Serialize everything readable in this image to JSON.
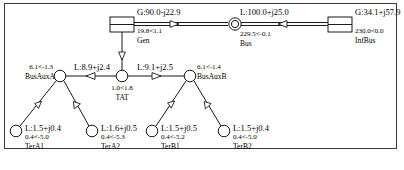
{
  "diagram": {
    "frame": {
      "border_color": "#3a3a3a"
    },
    "line_color": "#000000",
    "background": "#ffffff"
  },
  "nodes": [
    {
      "id": "gen",
      "name": "Gen",
      "symbol": "generator-box",
      "voltage": "19.8<1.1",
      "injection": "G:90.0-j22.9",
      "x": 122,
      "y": 25
    },
    {
      "id": "bus",
      "name": "Bus",
      "symbol": "bus-circle",
      "voltage": "229.5<-0.1",
      "injection": "L:100.0+j25.0",
      "x": 235,
      "y": 24
    },
    {
      "id": "infbus",
      "name": "InfBus",
      "symbol": "infinite-bus-box",
      "voltage": "230.0<0.0",
      "injection": "G:34.1+j57.9",
      "x": 340,
      "y": 24
    },
    {
      "id": "tat",
      "name": "TAT",
      "symbol": "node-circle",
      "voltage": "1.0<1.8",
      "x": 122,
      "y": 76
    },
    {
      "id": "busauxa",
      "name": "BusAuxA",
      "symbol": "node-circle",
      "voltage": "6.1<-1.3",
      "x": 60,
      "y": 76
    },
    {
      "id": "busauxb",
      "name": "BusAuxB",
      "symbol": "node-circle",
      "voltage": "6.1<-1.4",
      "x": 190,
      "y": 76
    },
    {
      "id": "tera1",
      "name": "TerA1",
      "symbol": "node-circle",
      "voltage": "0.4<-5.0",
      "injection": "L:1.5+j0.4",
      "x": 16,
      "y": 131
    },
    {
      "id": "tera2",
      "name": "TerA2",
      "symbol": "node-circle",
      "voltage": "0.4<-5.3",
      "injection": "L:1.6+j0.5",
      "x": 92,
      "y": 131
    },
    {
      "id": "terb1",
      "name": "TerB1",
      "symbol": "node-circle",
      "voltage": "0.4<-5.2",
      "injection": "L:1.5+j0.5",
      "x": 152,
      "y": 131
    },
    {
      "id": "terb2",
      "name": "TerB2",
      "symbol": "node-circle",
      "voltage": "0.4<-5.0",
      "injection": "L:1.5+j0.4",
      "x": 224,
      "y": 131
    }
  ],
  "branches": [
    {
      "id": "gen-bus",
      "from": "gen",
      "to": "bus",
      "style": "double",
      "flow_label": "G:90.0-j22.9",
      "arrow": "right"
    },
    {
      "id": "bus-infbus",
      "from": "bus",
      "to": "infbus",
      "style": "double",
      "flow_label": "L:100.0+j25.0",
      "arrow": "left"
    },
    {
      "id": "gen-tat",
      "from": "gen",
      "to": "tat",
      "style": "single",
      "flow_label": "",
      "arrow": "down"
    },
    {
      "id": "tat-busauxa",
      "from": "tat",
      "to": "busauxa",
      "style": "single",
      "flow_label": "L:8.9+j2.4",
      "arrow": "left"
    },
    {
      "id": "tat-busauxb",
      "from": "tat",
      "to": "busauxb",
      "style": "single",
      "flow_label": "L:9.1+j2.5",
      "arrow": "right"
    },
    {
      "id": "busauxa-tera1",
      "from": "busauxa",
      "to": "tera1",
      "style": "single",
      "flow_label": "",
      "arrow": "down-left"
    },
    {
      "id": "busauxa-tera2",
      "from": "busauxa",
      "to": "tera2",
      "style": "single",
      "flow_label": "",
      "arrow": "down-right"
    },
    {
      "id": "busauxb-terb1",
      "from": "busauxb",
      "to": "terb1",
      "style": "single",
      "flow_label": "",
      "arrow": "down-left"
    },
    {
      "id": "busauxb-terb2",
      "from": "busauxb",
      "to": "terb2",
      "style": "single",
      "flow_label": "",
      "arrow": "down-right"
    }
  ],
  "labels": {
    "gen_flow": "G:90.0-j22.9",
    "gen_voltage": "19.8<1.1",
    "gen_name": "Gen",
    "bus_flow": "L:100.0+j25.0",
    "bus_voltage": "229.5<-0.1",
    "bus_name": "Bus",
    "infbus_injection": "G:34.1+j57.9",
    "infbus_voltage": "230.0<0.0",
    "infbus_name": "InfBus",
    "busauxa_voltage": "6.1<-1.3",
    "busauxa_name": "BusAuxA",
    "busauxb_voltage": "6.1<-1.4",
    "busauxb_name": "BusAuxB",
    "tat_voltage": "1.0<1.8",
    "tat_name": "TAT",
    "left_branch_flow": "L:8.9+j2.4",
    "right_branch_flow": "L:9.1+j2.5",
    "tera1_injection": "L:1.5+j0.4",
    "tera1_voltage": "0.4<-5.0",
    "tera1_name": "TerA1",
    "tera2_injection": "L:1.6+j0.5",
    "tera2_voltage": "0.4<-5.3",
    "tera2_name": "TerA2",
    "terb1_injection": "L:1.5+j0.5",
    "terb1_voltage": "0.4<-5.2",
    "terb1_name": "TerB1",
    "terb2_injection": "L:1.5+j0.4",
    "terb2_voltage": "0.4<-5.0",
    "terb2_name": "TerB2"
  }
}
